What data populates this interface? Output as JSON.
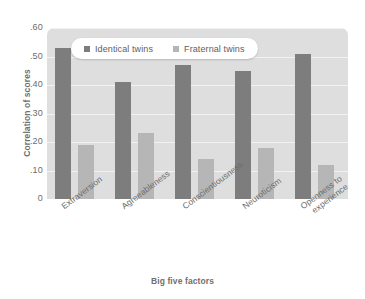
{
  "chart_data": {
    "type": "bar",
    "title": "",
    "xlabel": "Big five factors",
    "ylabel": "Correlation of scores",
    "categories": [
      "Extraversion",
      "Agreeableness",
      "Conscientiousness",
      "Neuroticism",
      "Openness to experience"
    ],
    "series": [
      {
        "name": "Identical twins",
        "color": "#7d7d7d",
        "values": [
          0.53,
          0.41,
          0.47,
          0.45,
          0.51
        ]
      },
      {
        "name": "Fraternal twins",
        "color": "#b6b6b6",
        "values": [
          0.19,
          0.23,
          0.14,
          0.18,
          0.12
        ]
      }
    ],
    "ylim": [
      0,
      0.6
    ],
    "ytick_values": [
      0.6,
      0.5,
      0.4,
      0.3,
      0.2,
      0.1,
      0
    ],
    "ytick_labels": [
      ".60",
      ".50",
      ".40",
      ".30",
      ".20",
      ".10",
      "0"
    ],
    "grid": true,
    "grid_axis": "y",
    "legend_position": "top-center",
    "plot_background": "#dedede",
    "gridline_color": "#f2f2f2"
  },
  "legend": {
    "items": [
      {
        "label": "Identical twins",
        "swatch": "legend-swatch-identical"
      },
      {
        "label": "Fraternal twins",
        "swatch": "legend-swatch-fraternal"
      }
    ]
  },
  "axes": {
    "y_title": "Correlation of scores",
    "x_title": "Big five factors",
    "y_ticks": [
      ".60",
      ".50",
      ".40",
      ".30",
      ".20",
      ".10",
      "0"
    ],
    "x_ticks": [
      "Extraversion",
      "Agreeableness",
      "Conscientiousness",
      "Neuroticism",
      "Openness to",
      "experience"
    ]
  }
}
